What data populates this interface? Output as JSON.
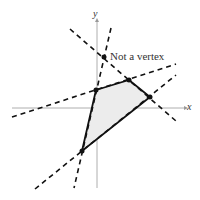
{
  "axes": {
    "x_label": "x",
    "y_label": "y"
  },
  "annotation": "Not a vertex",
  "region": {
    "fill": "#ececec",
    "vertices": [
      [
        96,
        90
      ],
      [
        129,
        80
      ],
      [
        150,
        97
      ],
      [
        82,
        151
      ]
    ]
  },
  "point_not_vertex": [
    104,
    57
  ]
}
